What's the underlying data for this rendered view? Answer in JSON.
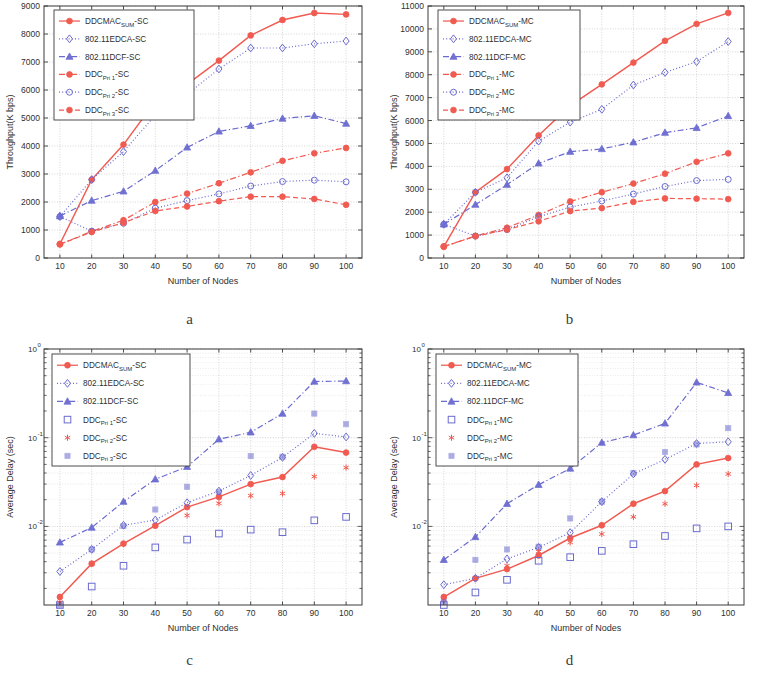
{
  "figure": {
    "panels": [
      "a",
      "b",
      "c",
      "d"
    ],
    "colors": {
      "red": "#f05a50",
      "blue": "#6a6ad0",
      "axis": "#3a3a3a",
      "grid": "#b9b9b9",
      "background": "#ffffff"
    }
  },
  "chart_data": [
    {
      "panel": "a",
      "type": "line",
      "title": "",
      "xlabel": "Number of Nodes",
      "ylabel": "Throughput(K bps)",
      "x": [
        10,
        20,
        30,
        40,
        50,
        60,
        70,
        80,
        90,
        100
      ],
      "xlim": [
        5,
        105
      ],
      "ylim": [
        0,
        9000
      ],
      "yticks": [
        0,
        1000,
        2000,
        3000,
        4000,
        5000,
        6000,
        7000,
        8000,
        9000
      ],
      "xticks": [
        10,
        20,
        30,
        40,
        50,
        60,
        70,
        80,
        90,
        100
      ],
      "yscale": "linear",
      "grid": true,
      "legend_position": "top-left",
      "series": [
        {
          "name": "DDCMAC_SUM-SC",
          "label_main": "DDCMAC",
          "label_sub": "SUM",
          "label_tail": "-SC",
          "color": "red",
          "marker": "filled-circle",
          "line": "solid",
          "values": [
            500,
            2800,
            4050,
            5600,
            6200,
            7050,
            7950,
            8500,
            8750,
            8700
          ]
        },
        {
          "name": "802.11EDCA-SC",
          "label_main": "802.11EDCA-SC",
          "label_sub": "",
          "label_tail": "",
          "color": "blue",
          "marker": "open-diamond",
          "line": "dotted",
          "values": [
            1480,
            2800,
            3800,
            5100,
            5850,
            6750,
            7500,
            7500,
            7650,
            7750
          ]
        },
        {
          "name": "802.11DCF-SC",
          "label_main": "802.11DCF-SC",
          "label_sub": "",
          "label_tail": "",
          "color": "blue",
          "marker": "filled-triangle",
          "line": "dashdot",
          "values": [
            1500,
            2050,
            2380,
            3120,
            3950,
            4520,
            4720,
            4980,
            5080,
            4800
          ]
        },
        {
          "name": "DDC_Pri1-SC",
          "label_main": "DDC",
          "label_sub": "Pri 1",
          "label_tail": "-SC",
          "color": "red",
          "marker": "filled-circle",
          "line": "dashdot",
          "values": [
            490,
            950,
            1350,
            2000,
            2300,
            2670,
            3060,
            3470,
            3740,
            3930
          ]
        },
        {
          "name": "DDC_Pri2-SC",
          "label_main": "DDC",
          "label_sub": "Pri 2",
          "label_tail": "-SC",
          "color": "blue",
          "marker": "open-circle",
          "line": "dotted",
          "values": [
            1480,
            960,
            1240,
            1780,
            2050,
            2290,
            2570,
            2730,
            2780,
            2720
          ]
        },
        {
          "name": "DDC_Pri3-SC",
          "label_main": "DDC",
          "label_sub": "Pri 3",
          "label_tail": "-SC",
          "color": "red",
          "marker": "filled-circle",
          "line": "dashed",
          "values": [
            490,
            930,
            1260,
            1680,
            1840,
            2030,
            2190,
            2190,
            2110,
            1900
          ]
        }
      ]
    },
    {
      "panel": "b",
      "type": "line",
      "title": "",
      "xlabel": "Number of Nodes",
      "ylabel": "Throughput(K bps)",
      "x": [
        10,
        20,
        30,
        40,
        50,
        60,
        70,
        80,
        90,
        100
      ],
      "xlim": [
        5,
        105
      ],
      "ylim": [
        0,
        11000
      ],
      "yticks": [
        0,
        1000,
        2000,
        3000,
        4000,
        5000,
        6000,
        7000,
        8000,
        9000,
        10000,
        11000
      ],
      "xticks": [
        10,
        20,
        30,
        40,
        50,
        60,
        70,
        80,
        90,
        100
      ],
      "yscale": "linear",
      "grid": true,
      "legend_position": "top-left",
      "series": [
        {
          "name": "DDCMAC_SUM-MC",
          "label_main": "DDCMAC",
          "label_sub": "SUM",
          "label_tail": "-MC",
          "color": "red",
          "marker": "filled-circle",
          "line": "solid",
          "values": [
            500,
            2870,
            3880,
            5350,
            6650,
            7580,
            8530,
            9480,
            10220,
            10700
          ]
        },
        {
          "name": "802.11EDCA-MC",
          "label_main": "802.11EDCA-MC",
          "label_sub": "",
          "label_tail": "",
          "color": "blue",
          "marker": "open-diamond",
          "line": "dotted",
          "values": [
            1470,
            2870,
            3500,
            5100,
            5930,
            6490,
            7550,
            8100,
            8570,
            9450
          ]
        },
        {
          "name": "802.11DCF-MC",
          "label_main": "802.11DCF-MC",
          "label_sub": "",
          "label_tail": "",
          "color": "blue",
          "marker": "filled-triangle",
          "line": "dashdot",
          "values": [
            1470,
            2330,
            3200,
            4130,
            4640,
            4760,
            5050,
            5470,
            5680,
            6200
          ]
        },
        {
          "name": "DDC_Pri1-MC",
          "label_main": "DDC",
          "label_sub": "Pri 1",
          "label_tail": "-MC",
          "color": "red",
          "marker": "filled-circle",
          "line": "dashdot",
          "values": [
            500,
            960,
            1320,
            1880,
            2470,
            2870,
            3250,
            3680,
            4200,
            4570
          ]
        },
        {
          "name": "DDC_Pri2-MC",
          "label_main": "DDC",
          "label_sub": "Pri 2",
          "label_tail": "-MC",
          "color": "blue",
          "marker": "open-circle",
          "line": "dotted",
          "values": [
            1470,
            960,
            1240,
            1800,
            2220,
            2490,
            2790,
            3120,
            3380,
            3430
          ]
        },
        {
          "name": "DDC_Pri3-MC",
          "label_main": "DDC",
          "label_sub": "Pri 3",
          "label_tail": "-MC",
          "color": "red",
          "marker": "filled-circle",
          "line": "dashed",
          "values": [
            500,
            950,
            1240,
            1600,
            2050,
            2180,
            2450,
            2600,
            2590,
            2570
          ]
        }
      ]
    },
    {
      "panel": "c",
      "type": "line",
      "title": "",
      "xlabel": "Number of Nodes",
      "ylabel": "Average Delay (sec)",
      "x": [
        10,
        20,
        30,
        40,
        50,
        60,
        70,
        80,
        90,
        100
      ],
      "xlim": [
        5,
        105
      ],
      "ylim": [
        0.0013,
        1.0
      ],
      "yticks": [
        1,
        0.1,
        0.01
      ],
      "ytick_labels": [
        "10^0",
        "10^-1",
        "10^-2"
      ],
      "xticks": [
        10,
        20,
        30,
        40,
        50,
        60,
        70,
        80,
        90,
        100
      ],
      "yscale": "log",
      "grid": true,
      "legend_position": "top-left",
      "series": [
        {
          "name": "DDCMAC_SUM-SC",
          "label_main": "DDCMAC",
          "label_sub": "SUM",
          "label_tail": "-SC",
          "color": "red",
          "marker": "filled-circle",
          "line": "solid",
          "values": [
            0.0016,
            0.0038,
            0.0064,
            0.0102,
            0.0165,
            0.0215,
            0.03,
            0.036,
            0.079,
            0.068
          ]
        },
        {
          "name": "802.11EDCA-SC",
          "label_main": "802.11EDCA-SC",
          "label_sub": "",
          "label_tail": "",
          "color": "blue",
          "marker": "open-diamond",
          "line": "dotted",
          "values": [
            0.0031,
            0.0055,
            0.0103,
            0.0118,
            0.0185,
            0.025,
            0.0375,
            0.06,
            0.112,
            0.102
          ]
        },
        {
          "name": "802.11DCF-SC",
          "label_main": "802.11DCF-SC",
          "label_sub": "",
          "label_tail": "",
          "color": "blue",
          "marker": "filled-triangle",
          "line": "dashdot",
          "values": [
            0.0066,
            0.0097,
            0.019,
            0.034,
            0.047,
            0.096,
            0.115,
            0.187,
            0.43,
            0.435
          ]
        },
        {
          "name": "DDC_Pri1-SC",
          "label_main": "DDC",
          "label_sub": "Pri 1",
          "label_tail": "-SC",
          "color": "blue",
          "marker": "open-square",
          "line": "none",
          "values": [
            0.0013,
            0.0021,
            0.0036,
            0.0058,
            0.0071,
            0.0083,
            0.0092,
            0.0086,
            0.0117,
            0.0128
          ]
        },
        {
          "name": "DDC_Pri2-SC",
          "label_main": "DDC",
          "label_sub": "Pri 2",
          "label_tail": "-SC",
          "color": "red",
          "marker": "asterisk",
          "line": "none",
          "values": [
            0.0014,
            0.0038,
            0.0063,
            0.0102,
            0.0133,
            0.0182,
            0.0222,
            0.0235,
            0.0365,
            0.046
          ]
        },
        {
          "name": "DDC_Pri3-SC",
          "label_main": "DDC",
          "label_sub": "Pri 3",
          "label_tail": "-SC",
          "color": "blue",
          "marker": "dotted-square",
          "line": "none",
          "values": [
            0.0013,
            0.0055,
            0.0101,
            0.0155,
            0.028,
            0.0245,
            0.062,
            0.061,
            0.187,
            0.142
          ]
        }
      ]
    },
    {
      "panel": "d",
      "type": "line",
      "title": "",
      "xlabel": "Number of Nodes",
      "ylabel": "Average Delay (sec)",
      "x": [
        10,
        20,
        30,
        40,
        50,
        60,
        70,
        80,
        90,
        100
      ],
      "xlim": [
        5,
        105
      ],
      "ylim": [
        0.0013,
        1.0
      ],
      "yticks": [
        1,
        0.1,
        0.01
      ],
      "ytick_labels": [
        "10^0",
        "10^-1",
        "10^-2"
      ],
      "xticks": [
        10,
        20,
        30,
        40,
        50,
        60,
        70,
        80,
        90,
        100
      ],
      "yscale": "log",
      "grid": true,
      "legend_position": "top-left",
      "series": [
        {
          "name": "DDCMAC_SUM-MC",
          "label_main": "DDCMAC",
          "label_sub": "SUM",
          "label_tail": "-MC",
          "color": "red",
          "marker": "filled-circle",
          "line": "solid",
          "values": [
            0.0016,
            0.0026,
            0.0033,
            0.0047,
            0.0074,
            0.0103,
            0.018,
            0.025,
            0.05,
            0.059
          ]
        },
        {
          "name": "802.11EDCA-MC",
          "label_main": "802.11EDCA-MC",
          "label_sub": "",
          "label_tail": "",
          "color": "blue",
          "marker": "open-diamond",
          "line": "dotted",
          "values": [
            0.0022,
            0.0026,
            0.0043,
            0.0058,
            0.0085,
            0.019,
            0.039,
            0.057,
            0.086,
            0.09
          ]
        },
        {
          "name": "802.11DCF-MC",
          "label_main": "802.11DCF-MC",
          "label_sub": "",
          "label_tail": "",
          "color": "blue",
          "marker": "filled-triangle",
          "line": "dashdot",
          "values": [
            0.0042,
            0.0076,
            0.018,
            0.0295,
            0.045,
            0.088,
            0.107,
            0.145,
            0.42,
            0.32
          ]
        },
        {
          "name": "DDC_Pri1-MC",
          "label_main": "DDC",
          "label_sub": "Pri 1",
          "label_tail": "-MC",
          "color": "blue",
          "marker": "open-square",
          "line": "none",
          "values": [
            0.0013,
            0.0018,
            0.0025,
            0.0041,
            0.0045,
            0.0053,
            0.0063,
            0.0078,
            0.0095,
            0.01
          ]
        },
        {
          "name": "DDC_Pri2-MC",
          "label_main": "DDC",
          "label_sub": "Pri 2",
          "label_tail": "-MC",
          "color": "red",
          "marker": "asterisk",
          "line": "none",
          "values": [
            0.0015,
            0.0026,
            0.0036,
            0.0052,
            0.0066,
            0.0082,
            0.0128,
            0.018,
            0.029,
            0.039
          ]
        },
        {
          "name": "DDC_Pri3-MC",
          "label_main": "DDC",
          "label_sub": "Pri 3",
          "label_tail": "-MC",
          "color": "blue",
          "marker": "dotted-square",
          "line": "none",
          "values": [
            0.0014,
            0.0042,
            0.0055,
            0.0059,
            0.0123,
            0.019,
            0.04,
            0.069,
            0.084,
            0.128
          ]
        }
      ]
    }
  ]
}
